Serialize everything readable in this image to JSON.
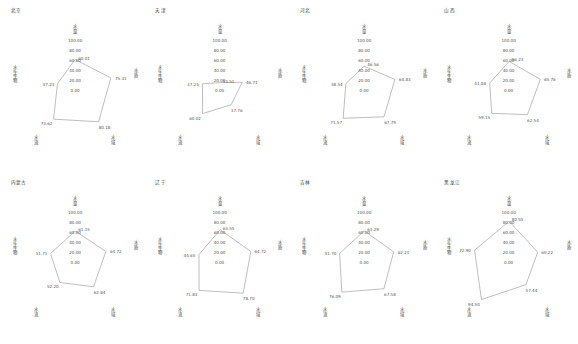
{
  "figure": {
    "grid_rows": 2,
    "grid_cols": 4,
    "line_color": "#8a8a8a",
    "text_color": "#4a4a4a",
    "background": "#ffffff"
  },
  "chart_data": {
    "type": "line",
    "subtype": "radar",
    "title": "",
    "xlabel": "",
    "ylabel": "",
    "ylim": [
      0,
      100
    ],
    "grid": false,
    "legend": "none",
    "axes_labels": [
      "水量",
      "水质",
      "水域",
      "水流",
      "水生生物"
    ],
    "tick_labels": [
      "0.00",
      "20.00",
      "40.00",
      "60.00",
      "80.00",
      "100.00"
    ],
    "ticks": [
      0,
      20,
      40,
      60,
      80,
      100
    ],
    "panels": [
      {
        "title": "北京",
        "categories": [
          "水量",
          "水质",
          "水域",
          "水流",
          "水生生物"
        ],
        "values": [
          60.01,
          75.31,
          80.18,
          73.62,
          37.23
        ],
        "labels": [
          "60.01",
          "75.31",
          "80.18",
          "73.62",
          "37.23"
        ]
      },
      {
        "title": "天津",
        "categories": [
          "水量",
          "水质",
          "水域",
          "水流",
          "水生生物"
        ],
        "values": [
          13.51,
          46.71,
          37.76,
          60.02,
          37.23
        ],
        "labels": [
          "13.51",
          "46.71",
          "37.76",
          "60.02",
          "37.23"
        ]
      },
      {
        "title": "河北",
        "categories": [
          "水量",
          "水质",
          "水域",
          "水流",
          "水生生物"
        ],
        "values": [
          46.56,
          64.83,
          67.79,
          71.57,
          38.54
        ],
        "labels": [
          "46.56",
          "64.83",
          "67.79",
          "71.57",
          "38.54"
        ]
      },
      {
        "title": "山西",
        "categories": [
          "水量",
          "水质",
          "水域",
          "水流",
          "水生生物"
        ],
        "values": [
          56.23,
          65.76,
          62.54,
          59.15,
          41.08
        ],
        "labels": [
          "56.23",
          "65.76",
          "62.54",
          "59.15",
          "41.08"
        ]
      },
      {
        "title": "内蒙古",
        "categories": [
          "水量",
          "水质",
          "水域",
          "水流",
          "水生生物"
        ],
        "values": [
          61.15,
          64.72,
          62.84,
          52.2,
          51.71
        ],
        "labels": [
          "61.15",
          "64.72",
          "62.84",
          "52.20",
          "51.71"
        ]
      },
      {
        "title": "辽宁",
        "categories": [
          "水量",
          "水质",
          "水域",
          "水流",
          "水生生物"
        ],
        "values": [
          63.55,
          64.72,
          78.7,
          71.83,
          44.65
        ],
        "labels": [
          "63.55",
          "64.72",
          "78.70",
          "71.83",
          "44.65"
        ]
      },
      {
        "title": "吉林",
        "categories": [
          "水量",
          "水质",
          "水域",
          "水流",
          "水生生物"
        ],
        "values": [
          61.29,
          62.21,
          67.58,
          76.09,
          51.7
        ],
        "labels": [
          "61.29",
          "62.21",
          "67.58",
          "76.09",
          "51.70"
        ]
      },
      {
        "title": "黑龙江",
        "categories": [
          "水量",
          "水质",
          "水域",
          "水流",
          "水生生物"
        ],
        "values": [
          80.55,
          60.22,
          57.44,
          94.5,
          72.9
        ],
        "labels": [
          "80.55",
          "60.22",
          "57.44",
          "94.50",
          "72.90"
        ]
      }
    ]
  }
}
